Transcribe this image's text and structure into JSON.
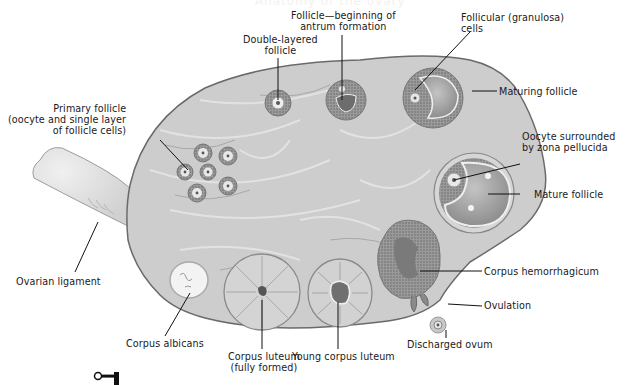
{
  "diagram": {
    "header_fragment": "Anatomy of the ovary",
    "colors": {
      "stroma": "#c9c9c9",
      "stroma_light": "#dcdcdc",
      "outline": "#6e6e6e",
      "follicle_cells": "#8a8a8a",
      "antrum": "#9e9e9e",
      "ligament": "#e2e2e2",
      "label_text": "#1a1a1a"
    },
    "labels": {
      "primary_follicle": [
        "Primary follicle",
        "(oocyte and single layer",
        "of follicle cells)"
      ],
      "double_layered_follicle": [
        "Double-layered",
        "follicle"
      ],
      "antrum_follicle": [
        "Follicle—beginning of",
        "antrum formation"
      ],
      "granulosa_cells": [
        "Follicular (granulosa)",
        "cells"
      ],
      "maturing_follicle": "Maturing follicle",
      "oocyte_zona": [
        "Oocyte surrounded",
        "by zona pellucida"
      ],
      "mature_follicle": "Mature follicle",
      "corpus_hemorrhagicum": "Corpus hemorrhagicum",
      "ovulation": "Ovulation",
      "discharged_ovum": "Discharged ovum",
      "young_corpus_luteum": "Young corpus luteum",
      "corpus_luteum": [
        "Corpus luteum",
        "(fully formed)"
      ],
      "corpus_albicans": "Corpus albicans",
      "ovarian_ligament": "Ovarian ligament"
    },
    "icons": {
      "key_icon": "key-icon"
    }
  }
}
